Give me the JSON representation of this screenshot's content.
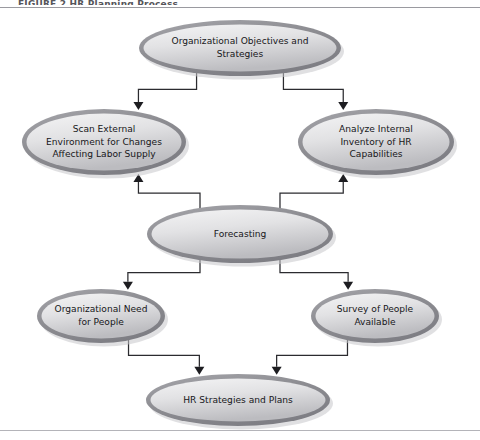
{
  "figure": {
    "caption_sliver": "FIGURE 2  HR Planning Process",
    "background_color": "#ffffff",
    "rule_color": "#b9b9bd"
  },
  "style": {
    "ellipse_border": "#8d8d92",
    "ellipse_fill_light": "#f2f2f3",
    "ellipse_fill_dark": "#b9b9bd",
    "shadow_color": "#bdbdc1",
    "connector_color": "#2b2b2f",
    "text_color": "#17171a"
  },
  "diagram": {
    "type": "flowchart",
    "orientation": "top-to-bottom",
    "nodes": [
      {
        "id": "objectives",
        "name": "organizational-objectives-node",
        "lines": [
          "Organizational Objectives and",
          "Strategies"
        ],
        "cx": 240,
        "cy": 48,
        "rx": 101,
        "ry": 28
      },
      {
        "id": "scan-external",
        "name": "scan-external-environment-node",
        "lines": [
          "Scan External",
          "Environment for Changes",
          "Affecting Labor Supply"
        ],
        "cx": 104,
        "cy": 142,
        "rx": 82,
        "ry": 33
      },
      {
        "id": "analyze-internal",
        "name": "analyze-internal-inventory-node",
        "lines": [
          "Analyze Internal",
          "Inventory of HR",
          "Capabilities"
        ],
        "cx": 376,
        "cy": 142,
        "rx": 78,
        "ry": 33
      },
      {
        "id": "forecasting",
        "name": "forecasting-node",
        "lines": [
          "Forecasting"
        ],
        "cx": 240,
        "cy": 234,
        "rx": 93,
        "ry": 29
      },
      {
        "id": "org-need",
        "name": "organizational-need-node",
        "lines": [
          "Organizational Need",
          "for People"
        ],
        "cx": 101,
        "cy": 316,
        "rx": 64,
        "ry": 27
      },
      {
        "id": "survey-people",
        "name": "survey-of-people-node",
        "lines": [
          "Survey of People",
          "Available"
        ],
        "cx": 375,
        "cy": 316,
        "rx": 64,
        "ry": 27
      },
      {
        "id": "hr-strategies",
        "name": "hr-strategies-and-plans-node",
        "lines": [
          "HR Strategies and Plans"
        ],
        "cx": 238,
        "cy": 400,
        "rx": 92,
        "ry": 26
      }
    ],
    "edges": [
      {
        "id": "e1",
        "name": "edge-objectives-to-scan-external",
        "from": "objectives",
        "to": "scan-external",
        "arrow": "down"
      },
      {
        "id": "e2",
        "name": "edge-objectives-to-analyze-internal",
        "from": "objectives",
        "to": "analyze-internal",
        "arrow": "down"
      },
      {
        "id": "e3",
        "name": "edge-forecasting-to-scan-external",
        "from": "forecasting",
        "to": "scan-external",
        "arrow": "up"
      },
      {
        "id": "e4",
        "name": "edge-forecasting-to-analyze-internal",
        "from": "forecasting",
        "to": "analyze-internal",
        "arrow": "up"
      },
      {
        "id": "e5",
        "name": "edge-forecasting-to-org-need",
        "from": "forecasting",
        "to": "org-need",
        "arrow": "down"
      },
      {
        "id": "e6",
        "name": "edge-forecasting-to-survey-people",
        "from": "forecasting",
        "to": "survey-people",
        "arrow": "down"
      },
      {
        "id": "e7",
        "name": "edge-org-need-to-hr-strategies",
        "from": "org-need",
        "to": "hr-strategies",
        "arrow": "down"
      },
      {
        "id": "e8",
        "name": "edge-survey-people-to-hr-strategies",
        "from": "survey-people",
        "to": "hr-strategies",
        "arrow": "down"
      }
    ]
  }
}
